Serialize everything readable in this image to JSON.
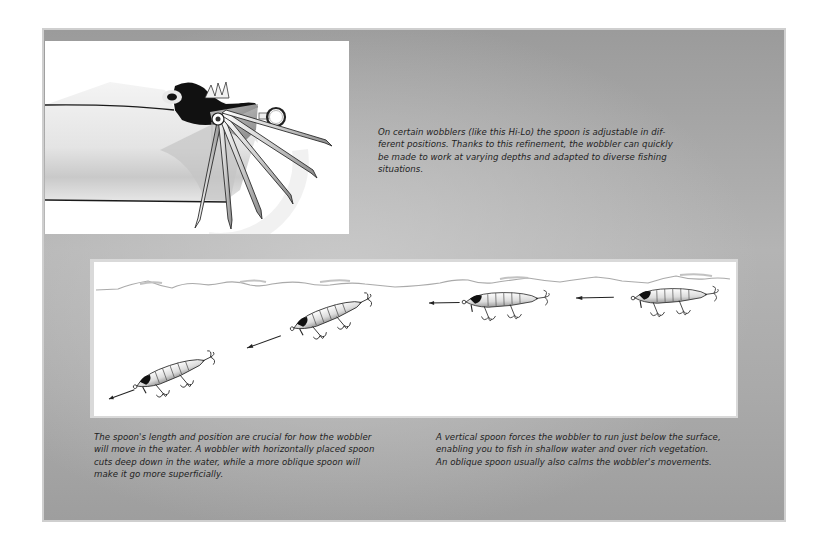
{
  "page": {
    "background_color": "#ffffff",
    "panel_color": "#a8a8a8"
  },
  "top_figure": {
    "subject": "Hi-Lo wobbler head with adjustable spoon shown in multiple positions",
    "icon": "adjustable-spoon-fan-illustration"
  },
  "top_caption": {
    "lines": [
      "On certain wobblers (like this Hi-Lo) the spoon is adjustable in dif-",
      "ferent positions. Thanks to this refinement, the wobbler can quickly",
      "be made to work at varying depths and adapted to diverse fishing",
      "situations."
    ]
  },
  "bottom_figure": {
    "subject": "Wobblers running at different depths below the water surface",
    "lures": [
      {
        "position": "deep",
        "icon": "wobbler-lure-icon"
      },
      {
        "position": "mid-deep",
        "icon": "wobbler-lure-icon"
      },
      {
        "position": "shallow",
        "icon": "wobbler-lure-icon"
      },
      {
        "position": "surface",
        "icon": "wobbler-lure-icon"
      }
    ],
    "arrow_icon": "direction-arrow-icon",
    "surface_icon": "water-surface-waves"
  },
  "bottom_left_caption": {
    "lines": [
      "The spoon's length and position are crucial for how the wobbler",
      "will move in the water. A wobbler with horizontally placed spoon",
      "cuts deep down in the water, while a more oblique spoon will",
      "make it go more superficially."
    ]
  },
  "bottom_right_caption": {
    "lines": [
      "A vertical spoon forces the wobbler to run just below the surface,",
      "enabling you to fish in shallow water and over rich vegetation.",
      "An oblique spoon usually also calms the wobbler's movements."
    ]
  }
}
